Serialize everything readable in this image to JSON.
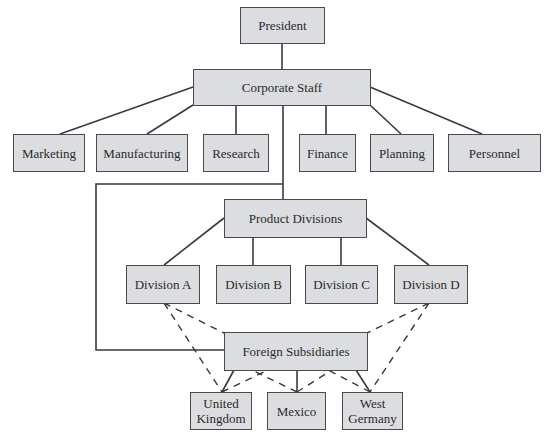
{
  "chart": {
    "type": "organization-chart",
    "nodes": {
      "president": "President",
      "corporate_staff": "Corporate Staff",
      "staff": [
        "Marketing",
        "Manufacturing",
        "Research",
        "Finance",
        "Planning",
        "Personnel"
      ],
      "product_divisions": "Product Divisions",
      "divisions": [
        "Division A",
        "Division B",
        "Division C",
        "Division D"
      ],
      "foreign_subsidiaries": "Foreign Subsidiaries",
      "subsidiaries": [
        "United\nKingdom",
        "Mexico",
        "West\nGermany"
      ]
    },
    "colors": {
      "box_fill": "#dcdde0",
      "box_border": "#4a4a4a",
      "line": "#3a3a3a",
      "text": "#2a2a2a"
    },
    "relations": {
      "solid": [
        [
          "President",
          "Corporate Staff"
        ],
        [
          "Corporate Staff",
          "Marketing"
        ],
        [
          "Corporate Staff",
          "Manufacturing"
        ],
        [
          "Corporate Staff",
          "Research"
        ],
        [
          "Corporate Staff",
          "Finance"
        ],
        [
          "Corporate Staff",
          "Planning"
        ],
        [
          "Corporate Staff",
          "Personnel"
        ],
        [
          "Corporate Staff",
          "Product Divisions"
        ],
        [
          "Corporate Staff",
          "Foreign Subsidiaries"
        ],
        [
          "Product Divisions",
          "Division A"
        ],
        [
          "Product Divisions",
          "Division B"
        ],
        [
          "Product Divisions",
          "Division C"
        ],
        [
          "Product Divisions",
          "Division D"
        ],
        [
          "Foreign Subsidiaries",
          "United Kingdom"
        ],
        [
          "Foreign Subsidiaries",
          "Mexico"
        ],
        [
          "Foreign Subsidiaries",
          "West Germany"
        ]
      ],
      "dashed": [
        [
          "Division A",
          "Foreign Subsidiaries"
        ],
        [
          "Division A",
          "United Kingdom"
        ],
        [
          "Division D",
          "Foreign Subsidiaries"
        ],
        [
          "Division D",
          "West Germany"
        ],
        [
          "United Kingdom",
          "Foreign Subsidiaries"
        ],
        [
          "Mexico",
          "Foreign Subsidiaries"
        ],
        [
          "West Germany",
          "Foreign Subsidiaries"
        ]
      ]
    }
  }
}
